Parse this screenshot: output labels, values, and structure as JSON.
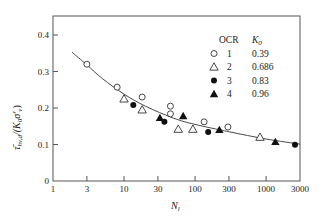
{
  "chart_data": {
    "type": "scatter",
    "title": "",
    "xlabel": "N_l",
    "ylabel": "τ̄_hv,d/(K₀σ'_v)",
    "xscale": "log",
    "xlim": [
      1,
      3000
    ],
    "ylim": [
      0,
      0.45
    ],
    "x_ticks": [
      1,
      3,
      10,
      30,
      100,
      300,
      1000,
      3000
    ],
    "x_tick_labels": [
      "1",
      "3",
      "10",
      "30",
      "100",
      "300",
      "1000",
      "3000"
    ],
    "y_ticks": [
      0,
      0.1,
      0.2,
      0.3,
      0.4
    ],
    "y_tick_labels": [
      "0",
      "0.1",
      "0.2",
      "0.3",
      "0.4"
    ],
    "grid": false,
    "legend": {
      "position": "upper right",
      "headers": [
        "OCR",
        "K0"
      ],
      "entries": [
        {
          "marker": "open-circle",
          "ocr": "1",
          "k0": "0.39"
        },
        {
          "marker": "open-triangle",
          "ocr": "2",
          "k0": "0.686"
        },
        {
          "marker": "filled-circle",
          "ocr": "3",
          "k0": "0.83"
        },
        {
          "marker": "filled-triangle",
          "ocr": "4",
          "k0": "0.96"
        }
      ]
    },
    "series": [
      {
        "name": "OCR 1 (K0=0.39)",
        "marker": "open-circle",
        "x": [
          3,
          8,
          18,
          45,
          45,
          134,
          290
        ],
        "y": [
          0.32,
          0.257,
          0.23,
          0.205,
          0.184,
          0.162,
          0.148
        ]
      },
      {
        "name": "OCR 2 (K0=0.686)",
        "marker": "open-triangle",
        "x": [
          10,
          18,
          58,
          93,
          820
        ],
        "y": [
          0.225,
          0.195,
          0.142,
          0.142,
          0.12
        ]
      },
      {
        "name": "OCR 3 (K0=0.83)",
        "marker": "filled-circle",
        "x": [
          13.5,
          37,
          153,
          2550
        ],
        "y": [
          0.208,
          0.162,
          0.134,
          0.099
        ]
      },
      {
        "name": "OCR 4 (K0=0.96)",
        "marker": "filled-triangle",
        "x": [
          32,
          68,
          220,
          1350
        ],
        "y": [
          0.173,
          0.178,
          0.14,
          0.107
        ]
      }
    ],
    "fit_curve": {
      "x": [
        1.85,
        3,
        5,
        10,
        20,
        50,
        100,
        300,
        1000,
        3000
      ],
      "y": [
        0.353,
        0.318,
        0.28,
        0.238,
        0.205,
        0.172,
        0.155,
        0.135,
        0.115,
        0.101
      ]
    }
  },
  "labels": {
    "ylabel_main": "τ̄",
    "ylabel_sub": "hv,d",
    "ylabel_rest": "/(K",
    "ylabel_k_sub": "0",
    "ylabel_sigma": "σ′",
    "ylabel_sigma_sub": "v",
    "ylabel_close": ")",
    "xlabel_main": "N",
    "xlabel_sub": "l",
    "legend_ocr_header": "OCR",
    "legend_k_header": "K",
    "legend_k_sub": "0"
  }
}
